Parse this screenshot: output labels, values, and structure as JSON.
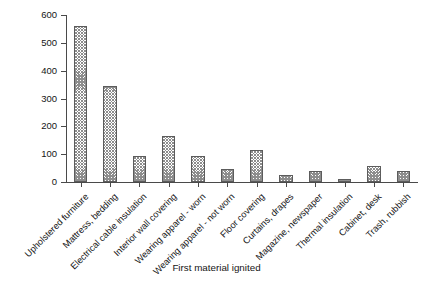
{
  "chart_data": {
    "type": "bar",
    "title": "",
    "xlabel": "First material ignited",
    "ylabel": "Average number of deaths/year",
    "ylim": [
      0,
      600
    ],
    "yticks": [
      0,
      100,
      200,
      300,
      400,
      500,
      600
    ],
    "grid": false,
    "legend": false,
    "categories": [
      "Upholstered furniture",
      "Mattress, bedding",
      "Electrical cable insulation",
      "Interior wall covering",
      "Wearing apparel - worn",
      "Wearing apparel - not worn",
      "Floor covering",
      "Curtains, drapes",
      "Magazine, newspaper",
      "Thermal insulation",
      "Cabinet, desk",
      "Trash, rubbish"
    ],
    "values": [
      560,
      345,
      95,
      165,
      95,
      45,
      115,
      25,
      40,
      10,
      58,
      40
    ],
    "bar_style": {
      "fill": "crosshatch",
      "hatch_color": "#8d8d8d",
      "edge_color": "#5c5c5c",
      "face_color": "#ffffff"
    }
  }
}
